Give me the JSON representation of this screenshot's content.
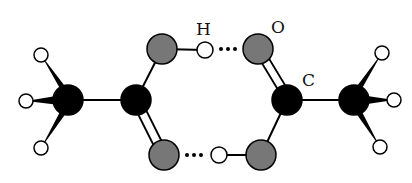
{
  "labels": {
    "hydrogen": "H",
    "oxygen": "O",
    "carbon": "C"
  },
  "colors": {
    "carbon": "#000000",
    "oxygen": "#777777",
    "hydrogen": "#ffffff",
    "bond": "#000000",
    "outline": "#000000"
  },
  "atoms": [
    {
      "id": "C1",
      "element": "carbon",
      "x": 68,
      "y": 100,
      "r": 15
    },
    {
      "id": "C2",
      "element": "carbon",
      "x": 136,
      "y": 100,
      "r": 15
    },
    {
      "id": "C3",
      "element": "carbon",
      "x": 287,
      "y": 100,
      "r": 15
    },
    {
      "id": "C4",
      "element": "carbon",
      "x": 354,
      "y": 100,
      "r": 15
    },
    {
      "id": "O1",
      "element": "oxygen",
      "x": 162,
      "y": 49,
      "r": 15
    },
    {
      "id": "O2",
      "element": "oxygen",
      "x": 164,
      "y": 155,
      "r": 15
    },
    {
      "id": "O3",
      "element": "oxygen",
      "x": 258,
      "y": 49,
      "r": 15
    },
    {
      "id": "O4",
      "element": "oxygen",
      "x": 261,
      "y": 155,
      "r": 15
    },
    {
      "id": "H1",
      "element": "hydrogen",
      "x": 41,
      "y": 55,
      "r": 7
    },
    {
      "id": "H2",
      "element": "hydrogen",
      "x": 26,
      "y": 101,
      "r": 7
    },
    {
      "id": "H3",
      "element": "hydrogen",
      "x": 41,
      "y": 148,
      "r": 7
    },
    {
      "id": "H4",
      "element": "hydrogen",
      "x": 382,
      "y": 53,
      "r": 7
    },
    {
      "id": "H5",
      "element": "hydrogen",
      "x": 394,
      "y": 100,
      "r": 7
    },
    {
      "id": "H6",
      "element": "hydrogen",
      "x": 380,
      "y": 147,
      "r": 7
    },
    {
      "id": "H7",
      "element": "hydrogen",
      "x": 205,
      "y": 50,
      "r": 8
    },
    {
      "id": "H8",
      "element": "hydrogen",
      "x": 219,
      "y": 155,
      "r": 8
    }
  ],
  "bonds": [
    {
      "from": "C1",
      "to": "C2",
      "type": "single"
    },
    {
      "from": "C2",
      "to": "O1",
      "type": "single"
    },
    {
      "from": "C2",
      "to": "O2",
      "type": "double"
    },
    {
      "from": "O1",
      "to": "H7",
      "type": "single"
    },
    {
      "from": "C3",
      "to": "C4",
      "type": "single"
    },
    {
      "from": "C3",
      "to": "O3",
      "type": "double"
    },
    {
      "from": "C3",
      "to": "O4",
      "type": "single"
    },
    {
      "from": "O4",
      "to": "H8",
      "type": "single"
    },
    {
      "from": "C1",
      "to": "H1",
      "type": "wedge"
    },
    {
      "from": "C1",
      "to": "H2",
      "type": "wedge"
    },
    {
      "from": "C1",
      "to": "H3",
      "type": "wedge"
    },
    {
      "from": "C4",
      "to": "H4",
      "type": "wedge"
    },
    {
      "from": "C4",
      "to": "H5",
      "type": "wedge"
    },
    {
      "from": "C4",
      "to": "H6",
      "type": "wedge"
    }
  ],
  "hydrogen_bonds": [
    {
      "from": "H7",
      "to": "O3"
    },
    {
      "from": "O2",
      "to": "H8"
    }
  ]
}
